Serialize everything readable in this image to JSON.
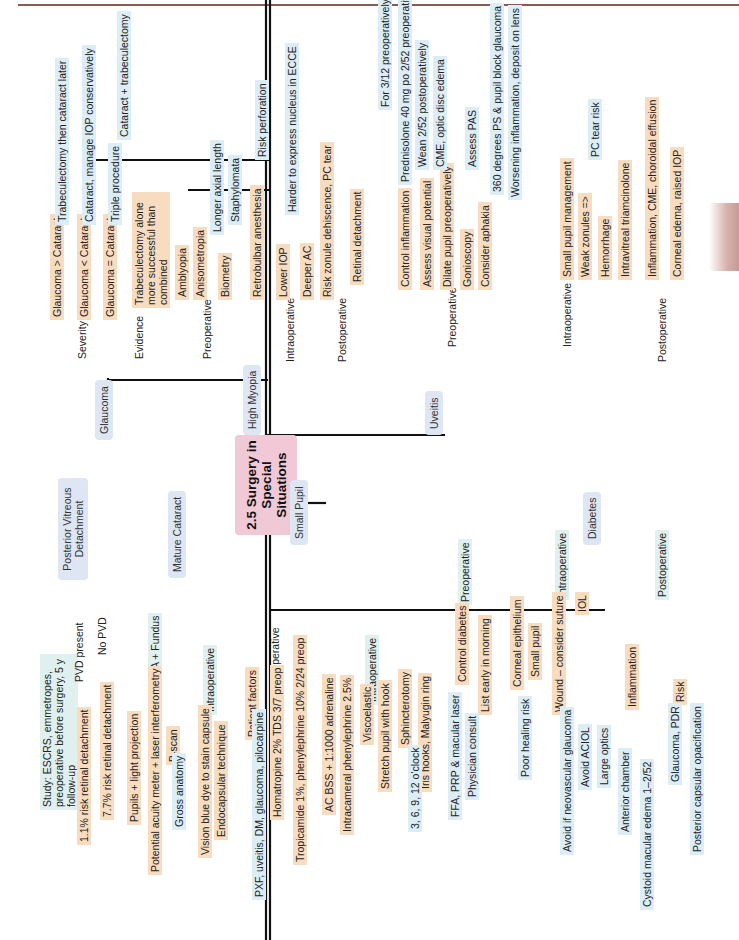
{
  "title": "2.5 Surgery in Special Situations",
  "colors": {
    "trunk": "#111111",
    "level1": "#5a9a78",
    "level2": "#d05a2c",
    "level3": "#3c5aa0",
    "root_bg": "#f0c8d6",
    "orange_bg": "#f8dcc0",
    "teal_bg": "#dff0ee",
    "blue_bg": "#dcedf6"
  },
  "branches": {
    "glaucoma": {
      "label": "Glaucoma",
      "severity": {
        "label": "Severity",
        "items": [
          {
            "label": "Glaucoma > Cataract",
            "detail": "Trabeculectomy then cataract later"
          },
          {
            "label": "Glaucoma < Cataract",
            "detail": "Cataract, manage IOP conservatively"
          },
          {
            "label": "Glaucoma = Cataract",
            "detail": "Triple procedure",
            "sub": "Cataract + trabeculectomy"
          }
        ]
      },
      "evidence": {
        "label": "Evidence",
        "detail": "Trabeculectomy alone more successful than combined"
      }
    },
    "high_myopia": {
      "label": "High Myopia",
      "preoperative": {
        "label": "Preoperative",
        "items": [
          "Amblyopia",
          "Anisometropia",
          "Biometry"
        ],
        "biometry_items": [
          "Longer axial length",
          "Staphylomata"
        ]
      },
      "intraoperative": {
        "label": "Intraoperative",
        "items": [
          "Retrobulbar anesthesia",
          "Lower IOP",
          "Deeper AC",
          "Risk zonule dehiscence, PC tear"
        ],
        "retrobulbar_detail": "Risk perforation",
        "lower_iop_detail": "Harder to express nucleus in ECCE"
      },
      "postoperative": {
        "label": "Postoperative",
        "items": [
          "Retinal detachment"
        ]
      }
    },
    "uveitis": {
      "label": "Uveitis",
      "preoperative": {
        "label": "Preoperative",
        "items": [
          "Control inflammation",
          "Assess visual potential",
          "Dilate pupil preoperatively",
          "Gonioscopy",
          "Consider aphakia"
        ],
        "control_inflammation": [
          "For 3/12 preoperatively",
          "Prednisolone 40 mg po 2/52 preoperatively",
          "Wean 2/52 postoperatively"
        ],
        "assess_visual_potential": "CME, optic disc edema",
        "gonioscopy": "Assess PAS",
        "consider_aphakia": [
          "360 degrees PS & pupil block glaucoma",
          "Worsening inflammation, deposit on lens"
        ]
      },
      "intraoperative": {
        "label": "Intraoperative",
        "items": [
          "Small pupil management",
          "Weak zonules =>",
          "Hemorrhage",
          "Intravitreal triamcinolone"
        ],
        "weak_zonules_detail": "PC tear risk"
      },
      "postoperative": {
        "label": "Postoperative",
        "items": [
          "Inflammation, CME, choroidal effusion",
          "Corneal edema, raised IOP"
        ]
      }
    },
    "pvd": {
      "label": "Posterior Vitreous Detachment",
      "study": "Study: ESCRS, emmetropes, preoperative before surgery, 5 y follow-up",
      "items": [
        {
          "label": "PVD present",
          "detail": "1.1% risk retinal detachment"
        },
        {
          "label": "No PVD",
          "detail": "7.7% risk retinal detachment"
        }
      ]
    },
    "mature_cataract": {
      "label": "Mature Cataract",
      "assess": {
        "label": "Assess VA + Fundus",
        "items": [
          "Pupils + light projection",
          "Potential acuity meter + laser interferometry",
          "B-scan"
        ],
        "bscan_detail": "Gross anatomy"
      },
      "intraoperative": {
        "label": "Intraoperative",
        "items": [
          "Vision blue dye to stain capsule",
          "Endocapsular technique"
        ]
      }
    },
    "small_pupil": {
      "label": "Small Pupil",
      "preoperative": {
        "label": "Preoperative",
        "items": [
          "Patient factors",
          "Homatropine 2% TDS 3/7 preop",
          "Tropicamide 1%, phenylephrine 10% 2/24 preop"
        ],
        "patient_factors_detail": "PXF, uveitis, DM, glaucoma, pilocarpine"
      },
      "intraoperative": {
        "label": "Intraoperative",
        "items": [
          "AC BSS + 1:1000 adrenaline",
          "Intracameral phenylephrine 2.5%",
          "Viscoelastic",
          "Stretch pupil with hook",
          "Sphincterotomy",
          "Iris hooks, Malyugin ring"
        ],
        "sphincterotomy_detail": "3, 6, 9, 12 o'clock"
      }
    },
    "diabetes": {
      "label": "Diabetes",
      "preoperative": {
        "label": "Preoperative",
        "items": [
          "Control diabetes",
          "List early in morning"
        ],
        "control_details": [
          "FFA, PRP & macular laser",
          "Physician consult"
        ]
      },
      "intraoperative": {
        "label": "Intraoperative",
        "items": [
          "Corneal epithelium",
          "Small pupil",
          "Wound – consider suture",
          "IOL"
        ],
        "corneal_detail": "Poor healing risk",
        "iol_details": [
          "Avoid if neovascular glaucoma",
          "Avoid ACIOL",
          "Large optics"
        ]
      },
      "postoperative": {
        "label": "Postoperative",
        "items": [
          "Inflammation",
          "Risk"
        ],
        "inflammation_details": [
          "Anterior chamber",
          "Cystoid macular edema 1–2/52"
        ],
        "risk_details": [
          "Glaucoma, PDR",
          "Posterior capsular opacification"
        ]
      }
    }
  }
}
